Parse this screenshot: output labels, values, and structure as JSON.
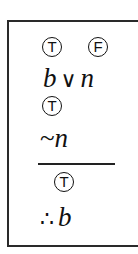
{
  "argument": {
    "premise1": {
      "truth_values": [
        {
          "label": "T",
          "position": "over-b"
        },
        {
          "label": "F",
          "position": "over-n"
        }
      ],
      "variable_left": "b",
      "operator": "∨",
      "variable_right": "n"
    },
    "premise2": {
      "truth_value": "T",
      "negation": "~",
      "variable": "n"
    },
    "conclusion": {
      "truth_value": "T",
      "therefore_symbol": "∴",
      "variable": "b"
    }
  },
  "colors": {
    "ink": "#111111",
    "border": "#2a2a2a",
    "background": "#ffffff"
  }
}
